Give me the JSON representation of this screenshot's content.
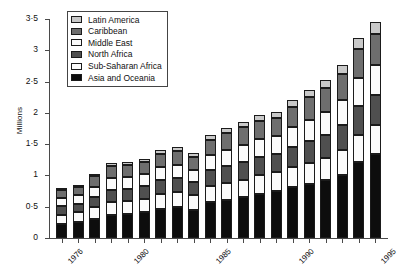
{
  "chart_data": {
    "type": "bar",
    "stacked": true,
    "title": "",
    "xlabel": "",
    "ylabel": "Millions",
    "ylim": [
      0,
      3.5
    ],
    "yticks": [
      0,
      0.5,
      1,
      1.5,
      2,
      2.5,
      3,
      3.5
    ],
    "ytick_labels": [
      "0",
      "0·5",
      "1",
      "1·5",
      "2",
      "2·5",
      "3",
      "3·5"
    ],
    "grid": false,
    "legend_position": "top-left",
    "categories": [
      "1976",
      "1977",
      "1978",
      "1979",
      "1980",
      "1981",
      "1982",
      "1983",
      "1984",
      "1985",
      "1986",
      "1987",
      "1988",
      "1989",
      "1990",
      "1991",
      "1992",
      "1993",
      "1994",
      "1995"
    ],
    "xtick_labels": [
      "1976",
      "1980",
      "1985",
      "1990",
      "1995"
    ],
    "xtick_label_indices": [
      0,
      4,
      9,
      14,
      19
    ],
    "series": [
      {
        "name": "Asia and Oceania",
        "color": "#0d0d0d",
        "values": [
          0.22,
          0.25,
          0.3,
          0.36,
          0.38,
          0.41,
          0.46,
          0.49,
          0.45,
          0.57,
          0.61,
          0.65,
          0.71,
          0.75,
          0.81,
          0.86,
          0.92,
          1.01,
          1.22,
          1.34
        ]
      },
      {
        "name": "Sub-Saharan Africa",
        "color": "#fbfbfb",
        "values": [
          0.15,
          0.16,
          0.19,
          0.21,
          0.21,
          0.22,
          0.24,
          0.25,
          0.23,
          0.26,
          0.27,
          0.28,
          0.29,
          0.3,
          0.33,
          0.34,
          0.36,
          0.39,
          0.43,
          0.46
        ]
      },
      {
        "name": "North Africa",
        "color": "#4f4f4f",
        "values": [
          0.14,
          0.14,
          0.17,
          0.2,
          0.2,
          0.2,
          0.22,
          0.22,
          0.21,
          0.25,
          0.27,
          0.29,
          0.3,
          0.3,
          0.32,
          0.35,
          0.37,
          0.41,
          0.46,
          0.49
        ]
      },
      {
        "name": "Middle East",
        "color": "#fbfbfb",
        "values": [
          0.13,
          0.13,
          0.16,
          0.19,
          0.18,
          0.19,
          0.21,
          0.21,
          0.2,
          0.24,
          0.26,
          0.27,
          0.28,
          0.28,
          0.31,
          0.34,
          0.36,
          0.39,
          0.44,
          0.47
        ]
      },
      {
        "name": "Caribbean",
        "color": "#6e6e6e",
        "values": [
          0.13,
          0.13,
          0.17,
          0.19,
          0.19,
          0.2,
          0.21,
          0.22,
          0.21,
          0.25,
          0.27,
          0.28,
          0.29,
          0.29,
          0.33,
          0.36,
          0.38,
          0.42,
          0.47,
          0.5
        ]
      },
      {
        "name": "Latin America",
        "color": "#c9c9c9",
        "values": [
          0.03,
          0.03,
          0.04,
          0.05,
          0.05,
          0.05,
          0.06,
          0.06,
          0.06,
          0.08,
          0.08,
          0.09,
          0.09,
          0.09,
          0.11,
          0.12,
          0.13,
          0.14,
          0.18,
          0.19
        ]
      }
    ],
    "legend": [
      {
        "label": "Latin America",
        "color": "#c9c9c9"
      },
      {
        "label": "Caribbean",
        "color": "#6e6e6e"
      },
      {
        "label": "Middle East",
        "color": "#fbfbfb"
      },
      {
        "label": "North Africa",
        "color": "#4f4f4f"
      },
      {
        "label": "Sub-Saharan Africa",
        "color": "#fbfbfb"
      },
      {
        "label": "Asia and Oceania",
        "color": "#0d0d0d"
      }
    ]
  }
}
